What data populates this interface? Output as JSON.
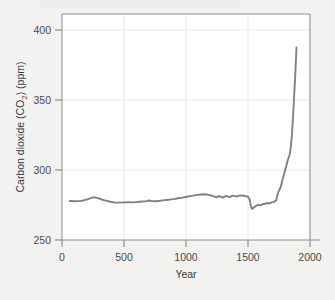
{
  "figure": {
    "background_color": "#f2f2f0",
    "plot_background_color": "#ffffff",
    "line_color": "#808080",
    "frame_color": "#8e8e8e",
    "grid_color": "#e2e2e2"
  },
  "axes": {
    "y_title": "Carbon dioxide (CO₂) (ppm)",
    "y_title_parts": {
      "prefix": "Carbon dioxide (CO",
      "subscript": "2",
      "suffix": ") (ppm)"
    },
    "x_title": "Year",
    "y_ticks": [
      "250",
      "300",
      "350",
      "400"
    ],
    "x_ticks": [
      "0",
      "500",
      "1000",
      "1500",
      "2000"
    ]
  },
  "chart_data": {
    "type": "line",
    "title": "",
    "subtitle": "",
    "xlabel": "Year",
    "ylabel": "Carbon dioxide (CO2) (ppm)",
    "xlim": [
      -70,
      2130
    ],
    "ylim": [
      250,
      412
    ],
    "xticks": [
      0,
      500,
      1000,
      1500,
      2000
    ],
    "yticks": [
      250,
      300,
      350,
      400
    ],
    "grid": true,
    "grid_axes": "both",
    "legend": null,
    "legend_position": "none",
    "annotations": [],
    "series": [
      {
        "name": "Atmospheric CO2 concentration",
        "color": "#808080",
        "x": [
          0,
          40,
          80,
          120,
          160,
          190,
          210,
          230,
          250,
          270,
          300,
          330,
          360,
          400,
          440,
          480,
          520,
          560,
          600,
          640,
          680,
          700,
          720,
          760,
          800,
          840,
          880,
          920,
          960,
          1000,
          1040,
          1080,
          1120,
          1160,
          1190,
          1220,
          1250,
          1280,
          1300,
          1320,
          1340,
          1360,
          1380,
          1400,
          1420,
          1440,
          1460,
          1480,
          1500,
          1520,
          1540,
          1560,
          1580,
          1595,
          1605,
          1615,
          1630,
          1650,
          1670,
          1690,
          1710,
          1730,
          1750,
          1770,
          1790,
          1810,
          1830,
          1850,
          1870,
          1890,
          1910,
          1930,
          1950,
          1960,
          1970,
          1980,
          1990,
          2000,
          2010
        ],
        "y": [
          278.0,
          277.8,
          277.9,
          278.3,
          279.3,
          280.2,
          280.6,
          280.4,
          280.0,
          279.4,
          278.6,
          278.0,
          277.4,
          276.8,
          276.8,
          277.0,
          277.1,
          277.0,
          277.2,
          277.6,
          277.9,
          278.3,
          278.0,
          277.8,
          278.1,
          278.6,
          278.9,
          279.3,
          279.9,
          280.4,
          281.0,
          281.6,
          282.2,
          282.6,
          282.8,
          282.5,
          282.0,
          281.3,
          280.6,
          281.5,
          281.0,
          280.4,
          281.6,
          281.2,
          280.7,
          281.8,
          281.6,
          281.1,
          281.8,
          282.0,
          281.7,
          281.4,
          281.0,
          279.0,
          274.5,
          272.3,
          273.2,
          274.4,
          275.2,
          274.8,
          275.6,
          276.0,
          276.4,
          276.3,
          277.0,
          277.3,
          278.4,
          284.7,
          288.0,
          294.5,
          300.1,
          306.5,
          311.3,
          316.9,
          325.7,
          338.7,
          354.4,
          369.5,
          388.0
        ]
      }
    ]
  }
}
